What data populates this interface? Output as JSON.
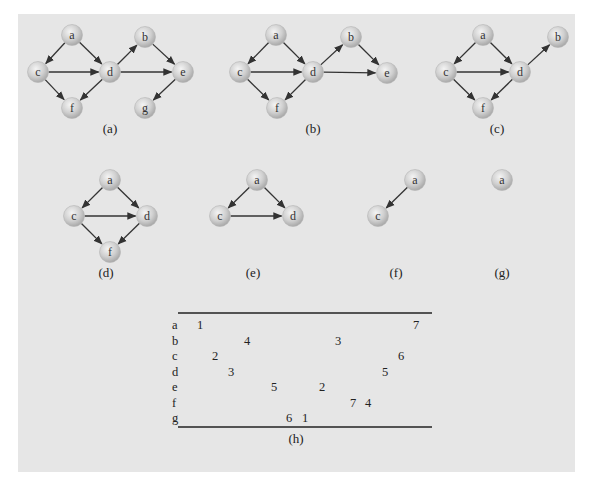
{
  "figure": {
    "panels": [
      {
        "id": "a",
        "caption": "(a)",
        "caption_pos": [
          110,
          133
        ],
        "nodes": [
          {
            "id": "a",
            "x": 72,
            "y": 35
          },
          {
            "id": "c",
            "x": 38,
            "y": 72
          },
          {
            "id": "d",
            "x": 110,
            "y": 72
          },
          {
            "id": "f",
            "x": 72,
            "y": 108
          },
          {
            "id": "b",
            "x": 145,
            "y": 37
          },
          {
            "id": "e",
            "x": 183,
            "y": 72
          },
          {
            "id": "g",
            "x": 145,
            "y": 108
          }
        ],
        "edges": [
          [
            "a",
            "c"
          ],
          [
            "a",
            "d"
          ],
          [
            "c",
            "d"
          ],
          [
            "c",
            "f"
          ],
          [
            "d",
            "f"
          ],
          [
            "d",
            "b"
          ],
          [
            "d",
            "e"
          ],
          [
            "b",
            "e"
          ],
          [
            "e",
            "g"
          ]
        ]
      },
      {
        "id": "b",
        "caption": "(b)",
        "caption_pos": [
          313,
          133
        ],
        "nodes": [
          {
            "id": "a",
            "x": 276,
            "y": 35
          },
          {
            "id": "c",
            "x": 240,
            "y": 72
          },
          {
            "id": "d",
            "x": 313,
            "y": 72
          },
          {
            "id": "f",
            "x": 277,
            "y": 108
          },
          {
            "id": "b",
            "x": 351,
            "y": 37
          },
          {
            "id": "e",
            "x": 387,
            "y": 73
          }
        ],
        "edges": [
          [
            "a",
            "c"
          ],
          [
            "a",
            "d"
          ],
          [
            "c",
            "d"
          ],
          [
            "c",
            "f"
          ],
          [
            "d",
            "f"
          ],
          [
            "d",
            "b"
          ],
          [
            "d",
            "e"
          ],
          [
            "b",
            "e"
          ]
        ]
      },
      {
        "id": "c",
        "caption": "(c)",
        "caption_pos": [
          497,
          133
        ],
        "nodes": [
          {
            "id": "a",
            "x": 483,
            "y": 35
          },
          {
            "id": "c",
            "x": 446,
            "y": 72
          },
          {
            "id": "d",
            "x": 520,
            "y": 72
          },
          {
            "id": "f",
            "x": 483,
            "y": 108
          },
          {
            "id": "b",
            "x": 558,
            "y": 37
          }
        ],
        "edges": [
          [
            "a",
            "c"
          ],
          [
            "a",
            "d"
          ],
          [
            "c",
            "d"
          ],
          [
            "c",
            "f"
          ],
          [
            "d",
            "f"
          ],
          [
            "d",
            "b"
          ]
        ]
      },
      {
        "id": "d",
        "caption": "(d)",
        "caption_pos": [
          106,
          277
        ],
        "nodes": [
          {
            "id": "a",
            "x": 110,
            "y": 180
          },
          {
            "id": "c",
            "x": 74,
            "y": 216
          },
          {
            "id": "d",
            "x": 147,
            "y": 216
          },
          {
            "id": "f",
            "x": 110,
            "y": 252
          }
        ],
        "edges": [
          [
            "a",
            "c"
          ],
          [
            "a",
            "d"
          ],
          [
            "c",
            "d"
          ],
          [
            "c",
            "f"
          ],
          [
            "d",
            "f"
          ]
        ]
      },
      {
        "id": "e",
        "caption": "(e)",
        "caption_pos": [
          253,
          277
        ],
        "nodes": [
          {
            "id": "a",
            "x": 257,
            "y": 180
          },
          {
            "id": "c",
            "x": 220,
            "y": 216
          },
          {
            "id": "d",
            "x": 293,
            "y": 216
          }
        ],
        "edges": [
          [
            "a",
            "c"
          ],
          [
            "a",
            "d"
          ],
          [
            "c",
            "d"
          ]
        ]
      },
      {
        "id": "f",
        "caption": "(f)",
        "caption_pos": [
          396,
          277
        ],
        "nodes": [
          {
            "id": "a",
            "x": 415,
            "y": 180
          },
          {
            "id": "c",
            "x": 378,
            "y": 216
          }
        ],
        "edges": [
          [
            "a",
            "c"
          ]
        ]
      },
      {
        "id": "g",
        "caption": "(g)",
        "caption_pos": [
          502,
          277
        ],
        "nodes": [
          {
            "id": "a",
            "x": 502,
            "y": 180
          }
        ],
        "edges": []
      }
    ],
    "table": {
      "caption": "(h)",
      "caption_pos": [
        296,
        443
      ],
      "rule_x": [
        178,
        432
      ],
      "rule_top_y": 313,
      "rule_bottom_y": 427,
      "label_x": 172,
      "row_y_start": 329,
      "row_step": 15.5,
      "rows": [
        {
          "label": "a",
          "values": [
            {
              "v": "1",
              "x": 200
            },
            {
              "v": "7",
              "x": 416
            }
          ]
        },
        {
          "label": "b",
          "values": [
            {
              "v": "4",
              "x": 247
            },
            {
              "v": "3",
              "x": 338
            }
          ]
        },
        {
          "label": "c",
          "values": [
            {
              "v": "2",
              "x": 215
            },
            {
              "v": "6",
              "x": 401
            }
          ]
        },
        {
          "label": "d",
          "values": [
            {
              "v": "3",
              "x": 231
            },
            {
              "v": "5",
              "x": 385
            }
          ]
        },
        {
          "label": "e",
          "values": [
            {
              "v": "5",
              "x": 274
            },
            {
              "v": "2",
              "x": 322
            }
          ]
        },
        {
          "label": "f",
          "values": [
            {
              "v": "7",
              "x": 353
            },
            {
              "v": "4",
              "x": 368
            }
          ]
        },
        {
          "label": "g",
          "values": [
            {
              "v": "6",
              "x": 289
            },
            {
              "v": "1",
              "x": 305
            }
          ]
        }
      ]
    }
  }
}
